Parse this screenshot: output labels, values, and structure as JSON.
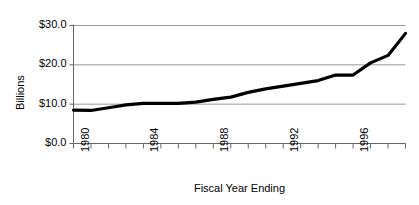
{
  "chart_data": {
    "type": "line",
    "title": "",
    "xlabel": "Fiscal Year Ending",
    "ylabel": "Billions",
    "xlim": [
      1980,
      1999
    ],
    "ylim": [
      0,
      30
    ],
    "grid": true,
    "legend": null,
    "y_ticks": [
      0,
      10,
      20,
      30
    ],
    "y_tick_labels": [
      "$0.0",
      "$10.0",
      "$20.0",
      "$30.0"
    ],
    "x_ticks": [
      1980,
      1981,
      1982,
      1983,
      1984,
      1985,
      1986,
      1987,
      1988,
      1989,
      1990,
      1991,
      1992,
      1993,
      1994,
      1995,
      1996,
      1997,
      1998,
      1999
    ],
    "x_tick_labels_shown": [
      "1980",
      "1984",
      "1988",
      "1992",
      "1996"
    ],
    "x": [
      1980,
      1981,
      1982,
      1983,
      1984,
      1985,
      1986,
      1987,
      1988,
      1989,
      1990,
      1991,
      1992,
      1993,
      1994,
      1995,
      1996,
      1997,
      1998,
      1999
    ],
    "values": [
      8.5,
      8.4,
      9.1,
      9.8,
      10.2,
      10.2,
      10.2,
      10.5,
      11.2,
      11.8,
      13.0,
      13.9,
      14.6,
      15.3,
      16.0,
      17.4,
      17.4,
      20.5,
      22.4,
      28.0
    ],
    "series": [
      {
        "name": "Billions",
        "color": "#000000",
        "values": [
          8.5,
          8.4,
          9.1,
          9.8,
          10.2,
          10.2,
          10.2,
          10.5,
          11.2,
          11.8,
          13.0,
          13.9,
          14.6,
          15.3,
          16.0,
          17.4,
          17.4,
          20.5,
          22.4,
          28.0
        ]
      }
    ]
  },
  "axes": {
    "y_labels": [
      "$30.0",
      "$20.0",
      "$10.0",
      "$0.0"
    ],
    "x_labels": [
      "1980",
      "1984",
      "1988",
      "1992",
      "1996"
    ],
    "title_x": "Fiscal Year Ending",
    "title_y": "Billions"
  },
  "colors": {
    "line": "#000000",
    "grid": "#999999",
    "axis": "#666666",
    "background": "#ffffff"
  }
}
